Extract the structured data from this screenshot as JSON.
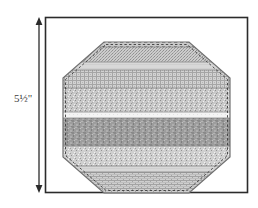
{
  "figure": {
    "dimension": {
      "label": "5½\"",
      "value": "5.5",
      "unit": "inch",
      "orientation": "vertical",
      "arrows": "both-ends"
    },
    "frame": {
      "shape": "rectangle",
      "stroke_color": "#2b2b2b",
      "fill_color": "#ffffff",
      "x": 45,
      "y": 17,
      "width": 203,
      "height": 176
    },
    "shape": {
      "name": "octagon",
      "outline_color": "#6b6b6b",
      "stitch_line": "dashed",
      "stitch_color": "#3a3a3a",
      "center_x": 146,
      "center_y": 117,
      "vertices": [
        [
          104,
          42
        ],
        [
          189,
          42
        ],
        [
          230,
          78
        ],
        [
          230,
          157
        ],
        [
          189,
          193
        ],
        [
          104,
          193
        ],
        [
          63,
          157
        ],
        [
          63,
          78
        ]
      ]
    },
    "bands": [
      {
        "index": 1,
        "name": "top-stitched-edge-strip",
        "texture": "dash-stitch",
        "color": "#c9c9c9",
        "y_top": 42,
        "y_bottom": 47
      },
      {
        "index": 2,
        "name": "fine-dot-strip",
        "texture": "fine-dots",
        "color": "#bdbdbd",
        "y_top": 47,
        "y_bottom": 62
      },
      {
        "index": 3,
        "name": "light-plain-strip",
        "texture": "plain-light",
        "color": "#d6d6d6",
        "y_top": 62,
        "y_bottom": 70
      },
      {
        "index": 4,
        "name": "crosshatch-weave-strip",
        "texture": "crosshatch",
        "color": "#c4c4c4",
        "y_top": 70,
        "y_bottom": 88
      },
      {
        "index": 5,
        "name": "speckle-strip",
        "texture": "speckle",
        "color": "#c0c0c0",
        "y_top": 88,
        "y_bottom": 112
      },
      {
        "index": 6,
        "name": "highlight-white-strip",
        "texture": "plain-white",
        "color": "#f2f2f2",
        "y_top": 112,
        "y_bottom": 118
      },
      {
        "index": 7,
        "name": "dark-mottled-strip",
        "texture": "mottled-dark",
        "color": "#9a9a9a",
        "y_top": 118,
        "y_bottom": 146
      },
      {
        "index": 8,
        "name": "coarse-speckle-strip",
        "texture": "coarse-speckle",
        "color": "#c8c8c8",
        "y_top": 146,
        "y_bottom": 166
      },
      {
        "index": 9,
        "name": "light-plain-strip-lower",
        "texture": "plain-light",
        "color": "#d4d4d4",
        "y_top": 166,
        "y_bottom": 172
      },
      {
        "index": 10,
        "name": "brick-weave-strip",
        "texture": "brick",
        "color": "#c2c2c2",
        "y_top": 172,
        "y_bottom": 193
      }
    ]
  }
}
